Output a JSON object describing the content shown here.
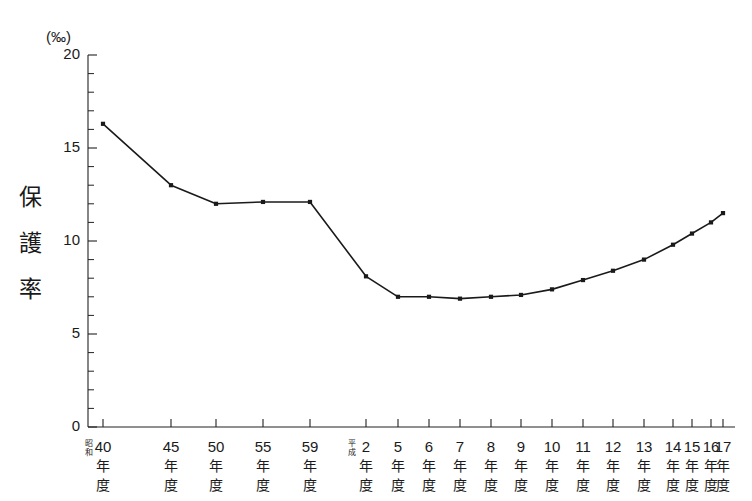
{
  "chart_data": {
    "type": "line",
    "title": "",
    "unit_label": "(‰)",
    "ylabel": "保護率",
    "ylabel_chars": [
      "保",
      "護",
      "率"
    ],
    "xlabel": "",
    "ylim": [
      0,
      20
    ],
    "ytick_labels": [
      "0",
      "5",
      "10",
      "15",
      "20"
    ],
    "ytick_values": [
      0,
      5,
      10,
      15,
      20
    ],
    "yminor_step": 1,
    "grid": false,
    "legend": "none",
    "categories": [
      "昭和40年度",
      "45年度",
      "50年度",
      "55年度",
      "59年度",
      "平成2年度",
      "5年度",
      "6年度",
      "7年度",
      "8年度",
      "9年度",
      "10年度",
      "11年度",
      "12年度",
      "13年度",
      "14年度",
      "15年度",
      "16年度",
      "17年度"
    ],
    "tick_labels": [
      {
        "era": "昭和",
        "num": "40",
        "k1": "年",
        "k2": "度",
        "major": true
      },
      {
        "era": "",
        "num": "45",
        "k1": "年",
        "k2": "度",
        "major": true
      },
      {
        "era": "",
        "num": "50",
        "k1": "年",
        "k2": "度",
        "major": true
      },
      {
        "era": "",
        "num": "55",
        "k1": "年",
        "k2": "度",
        "major": true
      },
      {
        "era": "",
        "num": "59",
        "k1": "年",
        "k2": "度",
        "major": true
      },
      {
        "era": "平成",
        "num": "2",
        "k1": "年",
        "k2": "度",
        "major": true
      },
      {
        "era": "",
        "num": "5",
        "k1": "年",
        "k2": "度",
        "major": true
      },
      {
        "era": "",
        "num": "6",
        "k1": "年",
        "k2": "度",
        "major": true
      },
      {
        "era": "",
        "num": "7",
        "k1": "年",
        "k2": "度",
        "major": true
      },
      {
        "era": "",
        "num": "8",
        "k1": "年",
        "k2": "度",
        "major": true
      },
      {
        "era": "",
        "num": "9",
        "k1": "年",
        "k2": "度",
        "major": true
      },
      {
        "era": "",
        "num": "10",
        "k1": "年",
        "k2": "度",
        "major": true
      },
      {
        "era": "",
        "num": "11",
        "k1": "年",
        "k2": "度",
        "major": true
      },
      {
        "era": "",
        "num": "12",
        "k1": "年",
        "k2": "度",
        "major": true
      },
      {
        "era": "",
        "num": "13",
        "k1": "年",
        "k2": "度",
        "major": true
      },
      {
        "era": "",
        "num": "14",
        "k1": "年",
        "k2": "度",
        "major": true
      },
      {
        "era": "",
        "num": "15",
        "k1": "年",
        "k2": "度",
        "major": true
      },
      {
        "era": "",
        "num": "16",
        "k1": "年",
        "k2": "度",
        "major": true
      },
      {
        "era": "",
        "num": "17",
        "k1": "年",
        "k2": "度",
        "major": true
      }
    ],
    "x_positions_px": [
      103,
      171,
      216,
      263,
      310,
      366,
      398,
      429,
      460,
      491,
      521,
      552,
      583,
      613,
      644,
      673,
      692,
      711,
      723
    ],
    "values": [
      16.3,
      13.0,
      12.0,
      12.1,
      12.1,
      8.1,
      7.0,
      7.0,
      6.9,
      7.0,
      7.1,
      7.4,
      7.9,
      8.4,
      9.0,
      9.8,
      10.4,
      11.0,
      11.5
    ],
    "series": [
      {
        "name": "保護率",
        "values": [
          16.3,
          13.0,
          12.0,
          12.1,
          12.1,
          8.1,
          7.0,
          7.0,
          6.9,
          7.0,
          7.1,
          7.4,
          7.9,
          8.4,
          9.0,
          9.8,
          10.4,
          11.0,
          11.5
        ]
      }
    ],
    "colors": {
      "line": "#1a1a1a",
      "marker": "#1a1a1a",
      "axis": "#222222",
      "background": "#ffffff"
    }
  }
}
